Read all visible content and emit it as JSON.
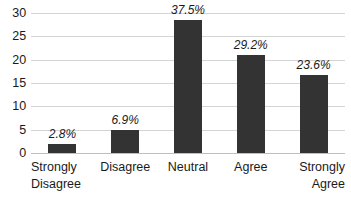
{
  "chart_data": {
    "type": "bar",
    "title": "",
    "subtitle": "",
    "xlabel": "",
    "ylabel": "",
    "categories": [
      "Strongly Disagree",
      "Disagree",
      "Neutral",
      "Agree",
      "Strongly Agree"
    ],
    "values": [
      2,
      5,
      28.5,
      21,
      16.8
    ],
    "data_labels": [
      "2.8%",
      "6.9%",
      "37.5%",
      "29.2%",
      "23.6%"
    ],
    "ylim": [
      0,
      30
    ],
    "y_ticks": [
      0,
      5,
      10,
      15,
      20,
      25,
      30
    ],
    "y_tick_labels": [
      "0",
      "5",
      "10",
      "15",
      "20",
      "25",
      "30"
    ],
    "grid": true,
    "legend": "none",
    "bar_color": "#333333",
    "gridline_color": "#d4d4d4",
    "axis_text_color": "#1a1a1a"
  },
  "bars": [
    {
      "category": "Strongly Disagree",
      "category_line1": "Strongly",
      "category_line2": "Disagree",
      "value": 2,
      "label": "2.8%"
    },
    {
      "category": "Disagree",
      "category_line1": "Disagree",
      "category_line2": "",
      "value": 5,
      "label": "6.9%"
    },
    {
      "category": "Neutral",
      "category_line1": "Neutral",
      "category_line2": "",
      "value": 28.5,
      "label": "37.5%"
    },
    {
      "category": "Agree",
      "category_line1": "Agree",
      "category_line2": "",
      "value": 21,
      "label": "29.2%"
    },
    {
      "category": "Strongly Agree",
      "category_line1": "Strongly",
      "category_line2": "Agree",
      "value": 16.8,
      "label": "23.6%"
    }
  ],
  "y_axis": {
    "ticks": [
      {
        "value": 30,
        "label": "30"
      },
      {
        "value": 25,
        "label": "25"
      },
      {
        "value": 20,
        "label": "20"
      },
      {
        "value": 15,
        "label": "15"
      },
      {
        "value": 10,
        "label": "10"
      },
      {
        "value": 5,
        "label": "5"
      },
      {
        "value": 0,
        "label": "0"
      }
    ]
  }
}
